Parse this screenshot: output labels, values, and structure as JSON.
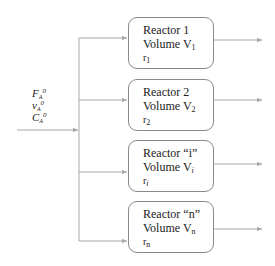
{
  "feed": {
    "labels": [
      {
        "symbol": "F",
        "sub": "A",
        "sup": "0"
      },
      {
        "symbol": "v",
        "sub": "A",
        "sup": "0"
      },
      {
        "symbol": "C",
        "sub": "A",
        "sup": "0"
      }
    ]
  },
  "reactors": [
    {
      "title": "Reactor 1",
      "volume": "Volume V",
      "volume_sub": "1",
      "rate": "r",
      "rate_sub": "1"
    },
    {
      "title": "Reactor 2",
      "volume": "Volume V",
      "volume_sub": "2",
      "rate": "r",
      "rate_sub": "2"
    },
    {
      "title": "Reactor “i”",
      "volume": "Volume V",
      "volume_sub": "i",
      "rate": "r",
      "rate_sub": "i"
    },
    {
      "title": "Reactor “n”",
      "volume": "Volume V",
      "volume_sub": "n",
      "rate": "r",
      "rate_sub": "n"
    }
  ],
  "colors": {
    "line": "#a8a8a8",
    "box_border": "#8a8a8a",
    "text": "#222222"
  }
}
